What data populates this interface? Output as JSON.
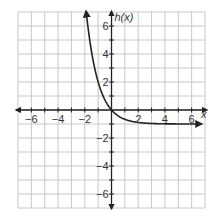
{
  "chart_data": {
    "type": "line",
    "title": "",
    "xlabel": "x",
    "ylabel": "h(x)",
    "xlim": [
      -7,
      7
    ],
    "ylim": [
      -7,
      7
    ],
    "grid": true,
    "x_ticks": [
      -6,
      -4,
      -2,
      2,
      4,
      6
    ],
    "y_ticks": [
      -6,
      -4,
      -2,
      2,
      4,
      6
    ],
    "x_tick_labels": [
      "−6",
      "−4",
      "−2",
      "2",
      "4",
      "6"
    ],
    "y_tick_labels": [
      "−6",
      "−4",
      "−2",
      "2",
      "4",
      "6"
    ],
    "series": [
      {
        "name": "h(x)",
        "description": "exponential decay through origin, horizontal asymptote y = -1",
        "x": [
          -1.9,
          -1.5,
          -1,
          -0.5,
          0,
          0.5,
          1,
          2,
          3,
          4,
          5,
          6.8
        ],
        "y": [
          7.06,
          4.2,
          2,
          0.73,
          0,
          -0.42,
          -0.67,
          -0.89,
          -0.96,
          -0.99,
          -1.0,
          -1.0
        ],
        "arrow_ends": true
      }
    ],
    "asymptote": -1,
    "legend": "none"
  },
  "labels": {
    "x_axis": "x",
    "y_axis": "h(x)"
  },
  "colors": {
    "grid": "#c8c8c8",
    "axis": "#222222",
    "curve": "#222222",
    "text": "#333333"
  }
}
